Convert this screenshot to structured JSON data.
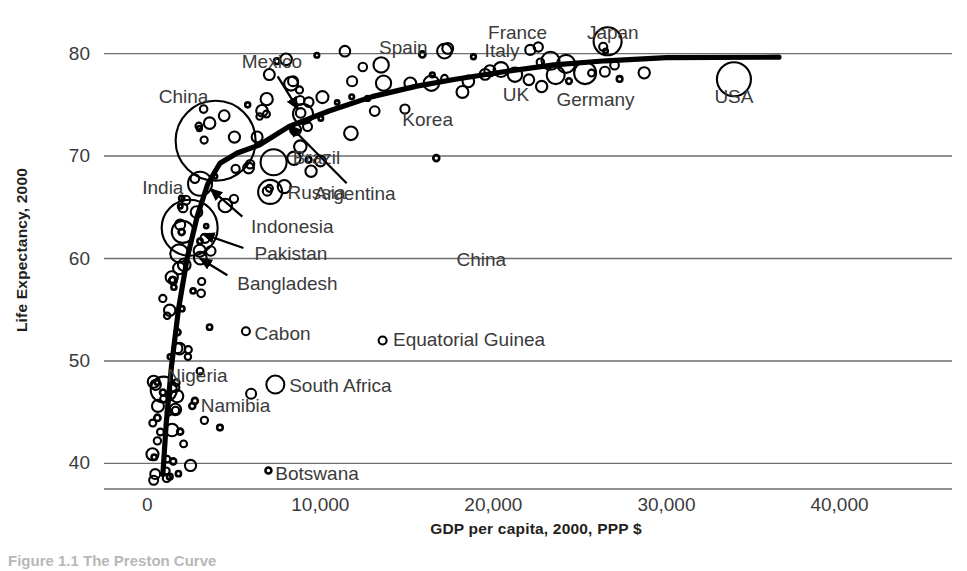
{
  "figure": {
    "caption": "Figure 1.1 The Preston Curve"
  },
  "axes": {
    "y_title": "Life Expectancy, 2000",
    "x_title": "GDP per capita, 2000, PPP $",
    "y_ticks": [
      "40",
      "50",
      "60",
      "70",
      "80"
    ],
    "y_tick_values": [
      40,
      50,
      60,
      70,
      80
    ],
    "x_ticks": [
      "0",
      "10,000",
      "20,000",
      "30,000",
      "40,000"
    ],
    "x_tick_values": [
      0,
      10000,
      20000,
      30000,
      40000
    ]
  },
  "colors": {
    "ink": "#231f20",
    "gridline": "#6d6d6d",
    "tick_text": "#3b3b3b",
    "curve": "#000000",
    "background": "#ffffff"
  },
  "chart_data": {
    "type": "scatter",
    "title": "",
    "subtitle": "",
    "xlabel": "GDP per capita, 2000, PPP $",
    "ylabel": "Life Expectancy, 2000",
    "xlim": [
      -2500,
      46500
    ],
    "ylim": [
      37.5,
      82.5
    ],
    "grid": "horizontal",
    "legend": "none",
    "marker": "open-circle, area proportional to population",
    "annotations": [
      {
        "text": "China",
        "x": 2100,
        "y": 75.8,
        "anchor": "middle",
        "arrow": false
      },
      {
        "text": "Mexico",
        "x": 7200,
        "y": 79.2,
        "anchor": "middle",
        "arrow": true,
        "arrow_to_x": 8700,
        "arrow_to_y": 74.6
      },
      {
        "text": "Spain",
        "x": 14800,
        "y": 80.5,
        "anchor": "middle",
        "arrow": false
      },
      {
        "text": "France",
        "x": 21400,
        "y": 82.0,
        "anchor": "middle",
        "arrow": false
      },
      {
        "text": "Italy",
        "x": 20500,
        "y": 80.3,
        "anchor": "middle",
        "arrow": false
      },
      {
        "text": "Japan",
        "x": 26900,
        "y": 82.0,
        "anchor": "middle",
        "arrow": false
      },
      {
        "text": "UK",
        "x": 21300,
        "y": 76.0,
        "anchor": "middle",
        "arrow": false
      },
      {
        "text": "Germany",
        "x": 25900,
        "y": 75.5,
        "anchor": "middle",
        "arrow": false
      },
      {
        "text": "USA",
        "x": 33900,
        "y": 75.8,
        "anchor": "middle",
        "arrow": false
      },
      {
        "text": "Korea",
        "x": 16200,
        "y": 73.5,
        "anchor": "middle",
        "arrow": false
      },
      {
        "text": "Brazil",
        "x": 8400,
        "y": 69.8,
        "anchor": "start",
        "arrow": false
      },
      {
        "text": "Russia",
        "x": 8100,
        "y": 66.4,
        "anchor": "start",
        "arrow": false
      },
      {
        "text": "Argentina",
        "x": 12000,
        "y": 66.3,
        "anchor": "middle",
        "arrow": true,
        "arrow_to_x": 8200,
        "arrow_to_y": 73.0
      },
      {
        "text": "India",
        "x": 900,
        "y": 66.9,
        "anchor": "middle",
        "arrow": false
      },
      {
        "text": "Indonesia",
        "x": 6000,
        "y": 63.1,
        "anchor": "start",
        "arrow": true,
        "arrow_to_x": 3650,
        "arrow_to_y": 66.8
      },
      {
        "text": "Pakistan",
        "x": 6200,
        "y": 60.4,
        "anchor": "start",
        "arrow": true,
        "arrow_to_x": 3200,
        "arrow_to_y": 62.4
      },
      {
        "text": "Bangladesh",
        "x": 5200,
        "y": 57.5,
        "anchor": "start",
        "arrow": true,
        "arrow_to_x": 3050,
        "arrow_to_y": 60.0
      },
      {
        "text": "China",
        "x": 19300,
        "y": 59.9,
        "anchor": "middle",
        "arrow": false
      },
      {
        "text": "Cabon",
        "x": 6200,
        "y": 52.6,
        "anchor": "start",
        "arrow": false
      },
      {
        "text": "Equatorial Guinea",
        "x": 14200,
        "y": 52.0,
        "anchor": "start",
        "arrow": false
      },
      {
        "text": "South Africa",
        "x": 8200,
        "y": 47.6,
        "anchor": "start",
        "arrow": false
      },
      {
        "text": "Nigeria",
        "x": 2900,
        "y": 48.5,
        "anchor": "middle",
        "arrow": false
      },
      {
        "text": "Namibia",
        "x": 5100,
        "y": 45.6,
        "anchor": "middle",
        "arrow": false
      },
      {
        "text": "Botswana",
        "x": 7400,
        "y": 39.0,
        "anchor": "start",
        "arrow": false
      }
    ],
    "curve": {
      "name": "Preston curve (fitted)",
      "points": [
        [
          900,
          38.9
        ],
        [
          1100,
          44.0
        ],
        [
          1400,
          49.5
        ],
        [
          1800,
          55.0
        ],
        [
          2300,
          60.0
        ],
        [
          2900,
          64.2
        ],
        [
          3500,
          67.3
        ],
        [
          4200,
          69.3
        ],
        [
          5200,
          70.3
        ],
        [
          6500,
          71.1
        ],
        [
          8200,
          72.9
        ],
        [
          10500,
          74.4
        ],
        [
          13000,
          75.8
        ],
        [
          15500,
          76.8
        ],
        [
          17800,
          77.5
        ],
        [
          20500,
          78.2
        ],
        [
          23500,
          78.9
        ],
        [
          26500,
          79.3
        ],
        [
          30000,
          79.6
        ],
        [
          36500,
          79.65
        ]
      ]
    },
    "points": [
      {
        "label": "USA",
        "x": 33900,
        "y": 77.5,
        "r": 17
      },
      {
        "label": "Japan",
        "x": 26600,
        "y": 81.2,
        "r": 14
      },
      {
        "label": "China",
        "x": 3950,
        "y": 71.5,
        "r": 40
      },
      {
        "label": "India",
        "x": 2450,
        "y": 63.0,
        "r": 28
      },
      {
        "label": "Indonesia",
        "x": 3050,
        "y": 67.3,
        "r": 12
      },
      {
        "label": "Pakistan",
        "x": 2050,
        "y": 62.6,
        "r": 11
      },
      {
        "label": "Bangladesh",
        "x": 1850,
        "y": 60.5,
        "r": 9
      },
      {
        "label": "Brazil",
        "x": 7300,
        "y": 69.4,
        "r": 13
      },
      {
        "label": "Russia",
        "x": 7100,
        "y": 66.5,
        "r": 12
      },
      {
        "label": "Nigeria",
        "x": 950,
        "y": 47.2,
        "r": 13
      },
      {
        "label": "Mexico",
        "x": 9000,
        "y": 74.1,
        "r": 10
      },
      {
        "label": "Germany",
        "x": 25300,
        "y": 78.1,
        "r": 11
      },
      {
        "label": "France",
        "x": 24200,
        "y": 79.0,
        "r": 9
      },
      {
        "label": "UK",
        "x": 23600,
        "y": 77.9,
        "r": 9
      },
      {
        "label": "Italy",
        "x": 23300,
        "y": 79.3,
        "r": 9
      },
      {
        "label": "South Africa",
        "x": 7400,
        "y": 47.7,
        "r": 9
      },
      {
        "label": "Equatorial Guinea",
        "x": 13600,
        "y": 52.0,
        "r": 4
      },
      {
        "label": "Cabon",
        "x": 5700,
        "y": 52.9,
        "r": 4
      },
      {
        "label": "Namibia",
        "x": 6000,
        "y": 46.8,
        "r": 5
      },
      {
        "label": "Botswana",
        "x": 7000,
        "y": 39.3,
        "r": 3
      },
      {
        "label": "Korea",
        "x": 16700,
        "y": 69.8,
        "r": 3
      }
    ]
  }
}
